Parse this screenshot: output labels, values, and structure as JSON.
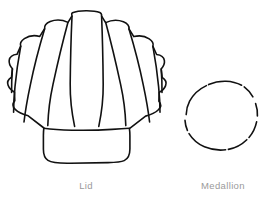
{
  "page": {
    "background_color": "#ffffff",
    "ink_color": "#111111",
    "caption_color": "#9a9a9a",
    "width": 270,
    "height": 203,
    "kind": "craft-pattern-template"
  },
  "figures": [
    {
      "id": "lid",
      "shape_name": "scallop-shell",
      "caption": "Lid",
      "stroke_color": "#111111",
      "stroke_width": 1.6,
      "fill": "none",
      "bounds": {
        "x": 14,
        "y": 10,
        "width": 144,
        "height": 155
      },
      "rib_count": 7
    },
    {
      "id": "medallion",
      "shape_name": "circle",
      "caption": "Medallion",
      "stroke_color": "#111111",
      "stroke_width": 1.6,
      "fill": "none",
      "bounds": {
        "x": 186,
        "y": 80,
        "width": 74,
        "height": 78
      },
      "center": {
        "x": 223,
        "y": 119
      },
      "radius": 38
    }
  ],
  "captions": {
    "lid": "Lid",
    "medallion": "Medallion"
  }
}
